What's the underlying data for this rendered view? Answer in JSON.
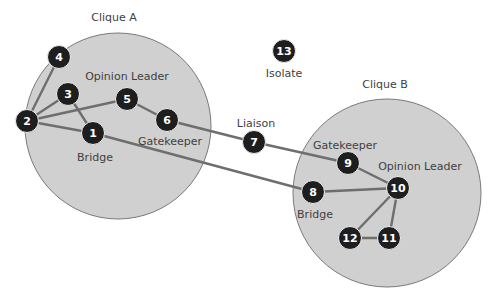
{
  "colors": {
    "background": "#ffffff",
    "clique_fill": "#d0d0d0",
    "clique_stroke": "#7a7a7a",
    "edge": "#6e6e6e",
    "node": "#1e1e1e",
    "node_text": "#ffffff",
    "label": "#3f3f3f"
  },
  "cliques": [
    {
      "id": "A",
      "label": "Clique A",
      "cx": 118,
      "cy": 126,
      "r": 93,
      "label_x": 114,
      "label_y": 21
    },
    {
      "id": "B",
      "label": "Clique B",
      "cx": 387,
      "cy": 193,
      "r": 94,
      "label_x": 385,
      "label_y": 88
    }
  ],
  "nodes": [
    {
      "id": 1,
      "label": "1",
      "x": 93,
      "y": 133
    },
    {
      "id": 2,
      "label": "2",
      "x": 27,
      "y": 121
    },
    {
      "id": 3,
      "label": "3",
      "x": 68,
      "y": 94
    },
    {
      "id": 4,
      "label": "4",
      "x": 59,
      "y": 57
    },
    {
      "id": 5,
      "label": "5",
      "x": 127,
      "y": 99
    },
    {
      "id": 6,
      "label": "6",
      "x": 167,
      "y": 120
    },
    {
      "id": 7,
      "label": "7",
      "x": 254,
      "y": 142
    },
    {
      "id": 8,
      "label": "8",
      "x": 313,
      "y": 192
    },
    {
      "id": 9,
      "label": "9",
      "x": 348,
      "y": 163
    },
    {
      "id": 10,
      "label": "10",
      "x": 398,
      "y": 188
    },
    {
      "id": 11,
      "label": "11",
      "x": 389,
      "y": 238
    },
    {
      "id": 12,
      "label": "12",
      "x": 350,
      "y": 238
    },
    {
      "id": 13,
      "label": "13",
      "x": 284,
      "y": 51
    }
  ],
  "edges": [
    [
      2,
      4
    ],
    [
      2,
      3
    ],
    [
      2,
      5
    ],
    [
      2,
      1
    ],
    [
      3,
      1
    ],
    [
      5,
      6
    ],
    [
      6,
      7
    ],
    [
      7,
      9
    ],
    [
      1,
      8
    ],
    [
      8,
      10
    ],
    [
      9,
      10
    ],
    [
      10,
      11
    ],
    [
      10,
      12
    ],
    [
      12,
      11
    ]
  ],
  "role_labels": [
    {
      "text": "Opinion Leader",
      "x": 127,
      "y": 80,
      "clique": "A"
    },
    {
      "text": "Gatekeeper",
      "x": 170,
      "y": 145,
      "clique": "A"
    },
    {
      "text": "Bridge",
      "x": 95,
      "y": 161,
      "clique": "A"
    },
    {
      "text": "Liaison",
      "x": 256,
      "y": 127,
      "clique": "none"
    },
    {
      "text": "Isolate",
      "x": 284,
      "y": 77,
      "clique": "none"
    },
    {
      "text": "Gatekeeper",
      "x": 345,
      "y": 149,
      "clique": "B"
    },
    {
      "text": "Opinion Leader",
      "x": 420,
      "y": 170,
      "clique": "B"
    },
    {
      "text": "Bridge",
      "x": 315,
      "y": 218,
      "clique": "B"
    }
  ]
}
